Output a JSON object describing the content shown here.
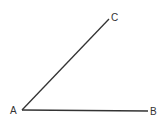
{
  "diagram": {
    "type": "angle",
    "stroke_color": "#333333",
    "points": [
      {
        "name": "A",
        "label": "A"
      },
      {
        "name": "B",
        "label": "B"
      },
      {
        "name": "C",
        "label": "C"
      }
    ],
    "segments": [
      "AB",
      "AC"
    ]
  }
}
